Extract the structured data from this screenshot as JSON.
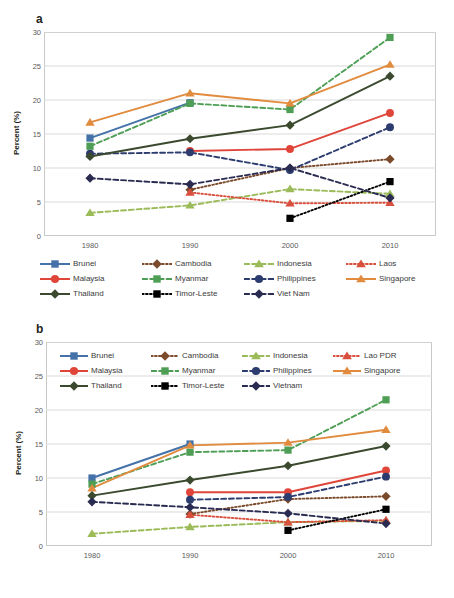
{
  "figure": {
    "panels": [
      {
        "letter": "a",
        "ylabel": "Percent (%)",
        "legend_inside": false,
        "legend_labels": [
          "Brunei",
          "Cambodia",
          "Indonesia",
          "Laos",
          "Malaysia",
          "Myanmar",
          "Philippines",
          "Singapore",
          "Thailand",
          "Timor-Leste",
          "Viet Nam"
        ]
      },
      {
        "letter": "b",
        "ylabel": "Percent (%)",
        "legend_inside": true,
        "legend_labels": [
          "Brunei",
          "Cambodia",
          "Indonesia",
          "Lao PDR",
          "Malaysia",
          "Myanmar",
          "Philippines",
          "Singapore",
          "Thailand",
          "Timor-Leste",
          "Vietnam"
        ]
      }
    ]
  },
  "chart_data": [
    {
      "type": "line",
      "panel": "a",
      "title": "",
      "xlabel": "",
      "ylabel": "Percent (%)",
      "categories": [
        "1980",
        "1990",
        "2000",
        "2010"
      ],
      "x": [
        1980,
        1990,
        2000,
        2010
      ],
      "ylim": [
        0,
        30
      ],
      "yticks": [
        0,
        5,
        10,
        15,
        20,
        25,
        30
      ],
      "grid": true,
      "legend_position": "below-axis",
      "series": [
        {
          "name": "Brunei",
          "values": [
            14.4,
            19.6,
            null,
            null
          ],
          "color": "#4472a8",
          "marker": "square",
          "dash": "solid"
        },
        {
          "name": "Cambodia",
          "values": [
            null,
            6.8,
            10.0,
            11.3
          ],
          "color": "#7b4a2b",
          "marker": "diamond",
          "dash": "dotted"
        },
        {
          "name": "Indonesia",
          "values": [
            3.4,
            4.5,
            6.9,
            6.2
          ],
          "color": "#9bbb59",
          "marker": "triangle",
          "dash": "dashed"
        },
        {
          "name": "Laos",
          "values": [
            null,
            6.4,
            4.8,
            4.9
          ],
          "color": "#d94f3d",
          "marker": "triangle",
          "dash": "dotted"
        },
        {
          "name": "Malaysia",
          "values": [
            null,
            12.5,
            12.8,
            18.1
          ],
          "color": "#e0453a",
          "marker": "circle",
          "dash": "solid"
        },
        {
          "name": "Myanmar",
          "values": [
            13.2,
            19.5,
            18.6,
            29.2
          ],
          "color": "#4f9e55",
          "marker": "square",
          "dash": "dashed"
        },
        {
          "name": "Philippines",
          "values": [
            12.1,
            12.3,
            9.7,
            16.0
          ],
          "color": "#2d3c6e",
          "marker": "circle",
          "dash": "dashed"
        },
        {
          "name": "Singapore",
          "values": [
            16.7,
            21.0,
            19.5,
            25.2
          ],
          "color": "#e18b3e",
          "marker": "triangle",
          "dash": "solid"
        },
        {
          "name": "Thailand",
          "values": [
            11.7,
            14.3,
            16.3,
            23.5
          ],
          "color": "#3b4a2e",
          "marker": "diamond",
          "dash": "solid"
        },
        {
          "name": "Timor-Leste",
          "values": [
            null,
            null,
            2.6,
            8.0
          ],
          "color": "#000000",
          "marker": "square",
          "dash": "dotted"
        },
        {
          "name": "Viet Nam",
          "values": [
            8.5,
            7.6,
            10.0,
            5.6
          ],
          "color": "#2a2b51",
          "marker": "diamond",
          "dash": "dashed"
        }
      ]
    },
    {
      "type": "line",
      "panel": "b",
      "title": "",
      "xlabel": "",
      "ylabel": "Percent (%)",
      "categories": [
        "1980",
        "1990",
        "2000",
        "2010"
      ],
      "x": [
        1980,
        1990,
        2000,
        2010
      ],
      "ylim": [
        0,
        30
      ],
      "yticks": [
        0,
        5,
        10,
        15,
        20,
        25,
        30
      ],
      "grid": true,
      "legend_position": "inside-top-left",
      "series": [
        {
          "name": "Brunei",
          "values": [
            10.0,
            15.0,
            null,
            null
          ],
          "color": "#4472a8",
          "marker": "square",
          "dash": "solid"
        },
        {
          "name": "Cambodia",
          "values": [
            null,
            4.7,
            6.9,
            7.3
          ],
          "color": "#7b4a2b",
          "marker": "diamond",
          "dash": "dotted"
        },
        {
          "name": "Indonesia",
          "values": [
            1.8,
            2.8,
            3.5,
            3.7
          ],
          "color": "#9bbb59",
          "marker": "triangle",
          "dash": "dashed"
        },
        {
          "name": "Lao PDR",
          "values": [
            null,
            4.6,
            3.5,
            3.8
          ],
          "color": "#d94f3d",
          "marker": "triangle",
          "dash": "dotted"
        },
        {
          "name": "Malaysia",
          "values": [
            null,
            7.9,
            7.9,
            11.1
          ],
          "color": "#e0453a",
          "marker": "circle",
          "dash": "solid"
        },
        {
          "name": "Myanmar",
          "values": [
            9.1,
            13.8,
            14.1,
            21.5
          ],
          "color": "#4f9e55",
          "marker": "square",
          "dash": "dashed"
        },
        {
          "name": "Philippines",
          "values": [
            null,
            6.8,
            7.2,
            10.2
          ],
          "color": "#2d3c6e",
          "marker": "circle",
          "dash": "dashed"
        },
        {
          "name": "Singapore",
          "values": [
            8.5,
            14.8,
            15.2,
            17.1
          ],
          "color": "#e18b3e",
          "marker": "triangle",
          "dash": "solid"
        },
        {
          "name": "Thailand",
          "values": [
            7.4,
            9.7,
            11.8,
            14.7
          ],
          "color": "#3b4a2e",
          "marker": "diamond",
          "dash": "solid"
        },
        {
          "name": "Timor-Leste",
          "values": [
            null,
            null,
            2.3,
            5.4
          ],
          "color": "#000000",
          "marker": "square",
          "dash": "dotted"
        },
        {
          "name": "Vietnam",
          "values": [
            6.5,
            5.7,
            4.8,
            3.3
          ],
          "color": "#2a2b51",
          "marker": "diamond",
          "dash": "dashed"
        }
      ]
    }
  ]
}
